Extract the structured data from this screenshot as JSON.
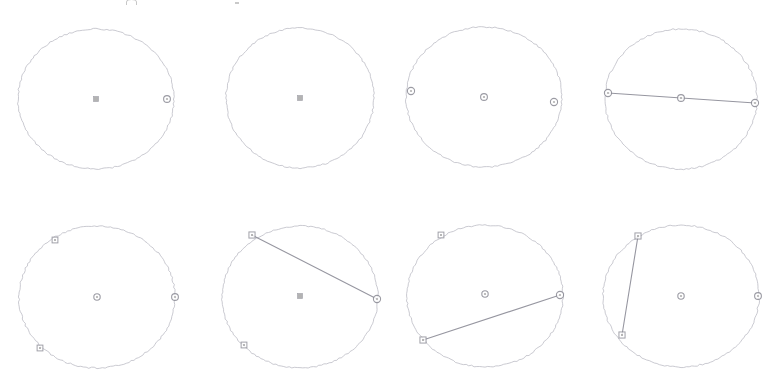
{
  "figure": {
    "canvas": {
      "width": 770,
      "height": 380
    },
    "background_color": "#ffffff",
    "stroke_color": "#b9b9c2",
    "chord_color": "#8b8b96",
    "point_fill": "#ffffff",
    "point_stroke": "#8a8a94",
    "center_marker_fill": "#9a9a9a",
    "stroke_width": 0.9,
    "chord_width": 1.1
  },
  "top_artifact": {
    "name": "cropped-toolbar-glyph",
    "note": "partial glyph clipped at the top edge of the screenshot"
  },
  "panels": [
    {
      "id": "panel-1",
      "label": "Step 1",
      "row": 1,
      "column": 1,
      "circle": {
        "cx": 96,
        "cy": 99,
        "rx": 78,
        "ry": 70
      },
      "center_marker": {
        "shape": "square",
        "cx": 96,
        "cy": 99,
        "size": 5
      },
      "points": [
        {
          "name": "point-right",
          "cx": 167,
          "cy": 99,
          "shape": "circle",
          "r": 3.4
        }
      ],
      "chords": []
    },
    {
      "id": "panel-2",
      "label": "Step 2",
      "row": 1,
      "column": 2,
      "circle": {
        "cx": 300,
        "cy": 98,
        "rx": 74,
        "ry": 70
      },
      "center_marker": {
        "shape": "square",
        "cx": 300,
        "cy": 98,
        "size": 5
      },
      "points": [],
      "chords": []
    },
    {
      "id": "panel-3",
      "label": "Step 3",
      "row": 1,
      "column": 3,
      "circle": {
        "cx": 484,
        "cy": 97,
        "rx": 78,
        "ry": 70
      },
      "center_marker": {
        "shape": "circle",
        "cx": 484,
        "cy": 97,
        "r": 3.4
      },
      "points": [
        {
          "name": "point-left",
          "cx": 411,
          "cy": 91,
          "shape": "circle",
          "r": 3.6
        },
        {
          "name": "point-right",
          "cx": 554,
          "cy": 102,
          "shape": "circle",
          "r": 3.6
        }
      ],
      "chords": []
    },
    {
      "id": "panel-4",
      "label": "Step 4",
      "row": 1,
      "column": 4,
      "circle": {
        "cx": 681,
        "cy": 99,
        "rx": 76,
        "ry": 70
      },
      "center_marker": {
        "shape": "circle",
        "cx": 681,
        "cy": 98,
        "r": 3.4
      },
      "points": [
        {
          "name": "point-left",
          "cx": 608,
          "cy": 93,
          "shape": "circle",
          "r": 3.6
        },
        {
          "name": "point-right",
          "cx": 755,
          "cy": 103,
          "shape": "circle",
          "r": 3.6
        }
      ],
      "chords": [
        {
          "name": "diameter",
          "x1": 608,
          "y1": 93,
          "x2": 755,
          "y2": 103
        }
      ]
    },
    {
      "id": "panel-5",
      "label": "Step 5",
      "row": 2,
      "column": 1,
      "circle": {
        "cx": 97,
        "cy": 297,
        "rx": 78,
        "ry": 71
      },
      "center_marker": {
        "shape": "circle",
        "cx": 97,
        "cy": 297,
        "r": 3.2
      },
      "points": [
        {
          "name": "point-upper-left",
          "cx": 55,
          "cy": 240,
          "shape": "square",
          "r": 3.4
        },
        {
          "name": "point-lower-left",
          "cx": 40,
          "cy": 348,
          "shape": "square",
          "r": 3.4
        },
        {
          "name": "point-right",
          "cx": 175,
          "cy": 297,
          "shape": "circle",
          "r": 3.4
        }
      ],
      "chords": []
    },
    {
      "id": "panel-6",
      "label": "Step 6",
      "row": 2,
      "column": 2,
      "circle": {
        "cx": 300,
        "cy": 297,
        "rx": 78,
        "ry": 71
      },
      "center_marker": {
        "shape": "square",
        "cx": 300,
        "cy": 296,
        "size": 5
      },
      "points": [
        {
          "name": "point-upper-left",
          "cx": 252,
          "cy": 235,
          "shape": "square",
          "r": 3.6
        },
        {
          "name": "point-lower-left",
          "cx": 244,
          "cy": 345,
          "shape": "square",
          "r": 3.4
        },
        {
          "name": "point-right",
          "cx": 377,
          "cy": 299,
          "shape": "circle",
          "r": 3.6
        }
      ],
      "chords": [
        {
          "name": "chord-upper-left-to-right",
          "x1": 252,
          "y1": 235,
          "x2": 377,
          "y2": 299
        }
      ]
    },
    {
      "id": "panel-7",
      "label": "Step 7",
      "row": 2,
      "column": 3,
      "circle": {
        "cx": 485,
        "cy": 296,
        "rx": 78,
        "ry": 71
      },
      "center_marker": {
        "shape": "circle",
        "cx": 485,
        "cy": 294,
        "r": 3.2
      },
      "points": [
        {
          "name": "point-upper-left",
          "cx": 441,
          "cy": 235,
          "shape": "square",
          "r": 3.4
        },
        {
          "name": "point-lower-left",
          "cx": 423,
          "cy": 340,
          "shape": "square",
          "r": 3.6
        },
        {
          "name": "point-right",
          "cx": 560,
          "cy": 295,
          "shape": "circle",
          "r": 3.6
        }
      ],
      "chords": [
        {
          "name": "chord-lower-left-to-right",
          "x1": 423,
          "y1": 340,
          "x2": 560,
          "y2": 295
        }
      ]
    },
    {
      "id": "panel-8",
      "label": "Step 8",
      "row": 2,
      "column": 4,
      "circle": {
        "cx": 681,
        "cy": 296,
        "rx": 78,
        "ry": 71
      },
      "center_marker": {
        "shape": "circle",
        "cx": 681,
        "cy": 296,
        "r": 3.2
      },
      "points": [
        {
          "name": "point-upper-left",
          "cx": 638,
          "cy": 236,
          "shape": "square",
          "r": 3.6
        },
        {
          "name": "point-lower-left",
          "cx": 622,
          "cy": 335,
          "shape": "square",
          "r": 3.6
        },
        {
          "name": "point-right",
          "cx": 758,
          "cy": 296,
          "shape": "circle",
          "r": 3.4
        }
      ],
      "chords": [
        {
          "name": "chord-upper-left-to-lower-left",
          "x1": 638,
          "y1": 236,
          "x2": 622,
          "y2": 335
        }
      ]
    }
  ]
}
